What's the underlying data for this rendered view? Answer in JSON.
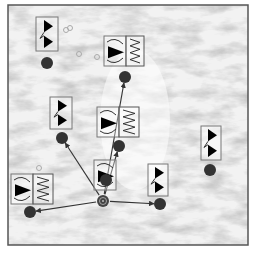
{
  "figure": {
    "width": 258,
    "height": 259,
    "frame": {
      "x": 8,
      "y": 5,
      "w": 240,
      "h": 240,
      "stroke": "#555555"
    },
    "background": {
      "base": "#f2f2f2",
      "texture": "grey marbled terrain"
    },
    "colors": {
      "node": "#333333",
      "arrow": "#333333",
      "box_stroke": "#777777",
      "glyph_fill": "#000000",
      "small_ring": "#aaaaaa"
    }
  },
  "hub": {
    "id": "hub",
    "x": 103,
    "y": 201,
    "r": 6,
    "symbol": "target-icon"
  },
  "nodes": [
    {
      "id": "n1",
      "x": 47,
      "y": 63,
      "box": {
        "x": 36,
        "y": 17,
        "w": 22,
        "h": 34
      },
      "glyph": "double-triangle",
      "wave_panel": false
    },
    {
      "id": "n2",
      "x": 125,
      "y": 77,
      "box": {
        "x": 104,
        "y": 36,
        "w": 22,
        "h": 30
      },
      "glyph": "triangle-wave",
      "wave_panel": true,
      "wave_box": {
        "x": 126,
        "y": 36,
        "w": 18,
        "h": 30
      }
    },
    {
      "id": "n3",
      "x": 62,
      "y": 138,
      "box": {
        "x": 50,
        "y": 97,
        "w": 22,
        "h": 32
      },
      "glyph": "double-triangle",
      "wave_panel": false
    },
    {
      "id": "n4",
      "x": 119,
      "y": 146,
      "box": {
        "x": 97,
        "y": 107,
        "w": 22,
        "h": 30
      },
      "glyph": "triangle-wave",
      "wave_panel": true,
      "wave_box": {
        "x": 119,
        "y": 107,
        "w": 20,
        "h": 30
      }
    },
    {
      "id": "n5",
      "x": 210,
      "y": 170,
      "box": {
        "x": 201,
        "y": 126,
        "w": 20,
        "h": 34
      },
      "glyph": "double-triangle",
      "wave_panel": false
    },
    {
      "id": "n6",
      "x": 106,
      "y": 180,
      "box": {
        "x": 94,
        "y": 160,
        "w": 22,
        "h": 30
      },
      "glyph": "triangle-wave",
      "wave_panel": false
    },
    {
      "id": "n7",
      "x": 30,
      "y": 212,
      "box": {
        "x": 11,
        "y": 174,
        "w": 22,
        "h": 30
      },
      "glyph": "triangle-wave",
      "wave_panel": true,
      "wave_box": {
        "x": 33,
        "y": 174,
        "w": 20,
        "h": 30
      }
    },
    {
      "id": "n8",
      "x": 160,
      "y": 204,
      "box": {
        "x": 148,
        "y": 164,
        "w": 20,
        "h": 32
      },
      "glyph": "double-triangle",
      "wave_panel": false
    }
  ],
  "edges": [
    {
      "from": "hub",
      "to": "n2"
    },
    {
      "from": "hub",
      "to": "n4"
    },
    {
      "from": "hub",
      "to": "n3"
    },
    {
      "from": "hub",
      "to": "n7"
    },
    {
      "from": "hub",
      "to": "n8"
    }
  ],
  "rings": [
    {
      "x": 66,
      "y": 30
    },
    {
      "x": 70,
      "y": 28
    },
    {
      "x": 79,
      "y": 54
    },
    {
      "x": 97,
      "y": 57
    },
    {
      "x": 39,
      "y": 168
    }
  ]
}
